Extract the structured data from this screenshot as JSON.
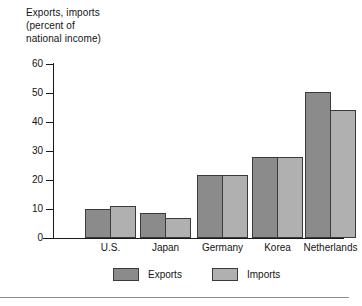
{
  "chart_data": {
    "type": "bar",
    "title": "Exports, imports\n(percent of\nnational income)",
    "xlabel": "",
    "ylabel": "",
    "ylim": [
      0,
      60
    ],
    "yticks": [
      0,
      10,
      20,
      30,
      40,
      50,
      60
    ],
    "grid": false,
    "legend_position": "bottom",
    "categories": [
      "U.S.",
      "Japan",
      "Germany",
      "Korea",
      "Netherlands"
    ],
    "series": [
      {
        "name": "Exports",
        "color": "#8b8b8b",
        "values": [
          10,
          8.5,
          21.8,
          28,
          50.2
        ]
      },
      {
        "name": "Imports",
        "color": "#b0b0b0",
        "values": [
          11,
          7,
          21.8,
          28,
          44
        ]
      }
    ]
  },
  "axis": {
    "tick_labels": [
      "60",
      "50",
      "40",
      "30",
      "20",
      "10",
      "0"
    ]
  },
  "legend": {
    "items": [
      {
        "label": "Exports"
      },
      {
        "label": "Imports"
      }
    ]
  }
}
